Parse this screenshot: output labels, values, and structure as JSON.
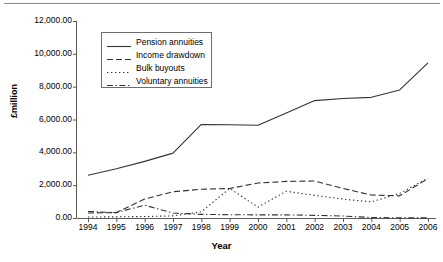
{
  "chart_data": {
    "type": "line",
    "title": "",
    "subtitle": "",
    "xlabel": "Year",
    "ylabel": "£million",
    "categories": [
      "1994",
      "1995",
      "1996",
      "1997",
      "1998",
      "1999",
      "2000",
      "2001",
      "2002",
      "2003",
      "2004",
      "2005",
      "2006"
    ],
    "xlim": [
      1994,
      2006
    ],
    "ylim": [
      0,
      12000
    ],
    "ytick_labels": [
      "0.00",
      "2,000.00",
      "4,000.00",
      "6,000.00",
      "8,000.00",
      "10,000.00",
      "12,000.00"
    ],
    "ytick_values": [
      0,
      2000,
      4000,
      6000,
      8000,
      10000,
      12000
    ],
    "grid": false,
    "legend_position": "upper-left-inside",
    "series": [
      {
        "name": "Pension annuities",
        "style": "solid",
        "values": [
          2600,
          3000,
          3450,
          3950,
          5700,
          5680,
          5650,
          6400,
          7150,
          7280,
          7350,
          7800,
          9450
        ]
      },
      {
        "name": "Income drawdown",
        "style": "dashed",
        "values": [
          300,
          330,
          1150,
          1600,
          1750,
          1800,
          2130,
          2230,
          2250,
          1800,
          1400,
          1350,
          2400
        ]
      },
      {
        "name": "Bulk buyouts",
        "style": "dotted",
        "values": [
          60,
          70,
          90,
          130,
          380,
          1800,
          660,
          1630,
          1380,
          1150,
          980,
          1500,
          2420
        ]
      },
      {
        "name": "Voluntary annuities",
        "style": "dash-dot",
        "values": [
          400,
          330,
          780,
          300,
          220,
          200,
          190,
          190,
          160,
          120,
          30,
          10,
          5
        ]
      }
    ]
  }
}
